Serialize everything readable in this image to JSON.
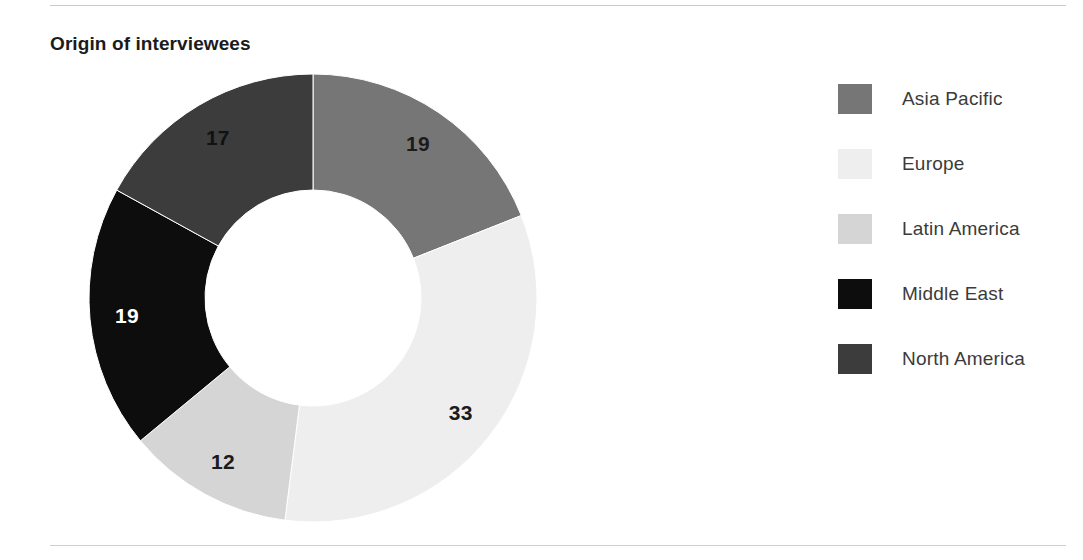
{
  "header": {
    "title": "Origin of interviewees"
  },
  "chart_data": {
    "type": "pie",
    "variant": "donut",
    "title": "Origin of interviewees",
    "xlabel": "",
    "ylabel": "",
    "legend_position": "right",
    "grid": false,
    "start_angle_deg": 0,
    "direction": "clockwise",
    "total": 100,
    "categories": [
      "Asia Pacific",
      "Europe",
      "Latin America",
      "Middle East",
      "North America"
    ],
    "values": [
      19,
      33,
      12,
      19,
      17
    ],
    "slices": [
      {
        "label": "Asia Pacific",
        "value": 19,
        "value_text": "19",
        "color": "#767676",
        "label_color": "#1b1b1b"
      },
      {
        "label": "Europe",
        "value": 33,
        "value_text": "33",
        "color": "#eeeeee",
        "label_color": "#1b1b1b"
      },
      {
        "label": "Latin America",
        "value": 12,
        "value_text": "12",
        "color": "#d5d5d5",
        "label_color": "#1b1b1b"
      },
      {
        "label": "Middle East",
        "value": 19,
        "value_text": "19",
        "color": "#0d0d0d",
        "label_color": "#ffffff"
      },
      {
        "label": "North America",
        "value": 17,
        "value_text": "17",
        "color": "#3c3c3c",
        "label_color": "#111111"
      }
    ]
  },
  "legend": {
    "items": [
      {
        "label": "Asia Pacific",
        "color": "#767676"
      },
      {
        "label": "Europe",
        "color": "#eeeeee"
      },
      {
        "label": "Latin America",
        "color": "#d5d5d5"
      },
      {
        "label": "Middle East",
        "color": "#0d0d0d"
      },
      {
        "label": "North America",
        "color": "#3c3c3c"
      }
    ]
  },
  "colors": {
    "accent": "#767676",
    "rule": "#c9c9c9",
    "text": "#231f20",
    "background": "#ffffff"
  }
}
